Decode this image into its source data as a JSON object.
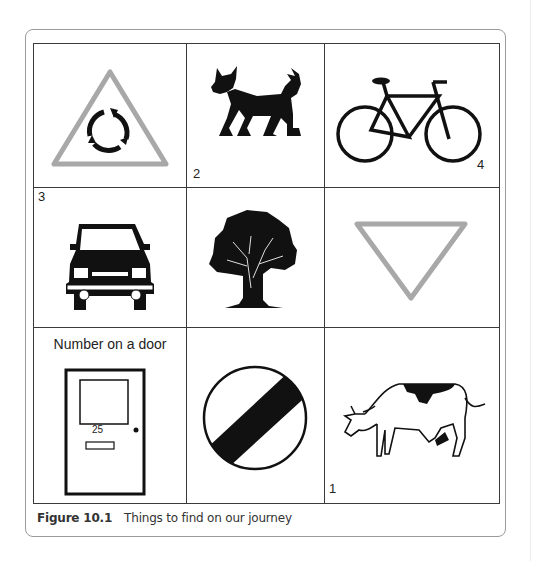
{
  "figure": {
    "label": "Figure 10.1",
    "caption": "Things to find on our journey"
  },
  "colors": {
    "grid_line": "#3a3a3a",
    "sign_grey": "#a8a8a8",
    "ink": "#111111"
  },
  "cells": [
    {
      "row": 1,
      "col": 1,
      "icon": "roundabout-warning-sign-icon",
      "number": ""
    },
    {
      "row": 1,
      "col": 2,
      "icon": "dog-icon",
      "number": "2"
    },
    {
      "row": 1,
      "col": 3,
      "icon": "bicycle-icon",
      "number": "4"
    },
    {
      "row": 2,
      "col": 1,
      "icon": "car-icon",
      "number": "3"
    },
    {
      "row": 2,
      "col": 2,
      "icon": "tree-icon",
      "number": ""
    },
    {
      "row": 2,
      "col": 3,
      "icon": "give-way-sign-icon",
      "number": ""
    },
    {
      "row": 3,
      "col": 1,
      "icon": "door-icon",
      "number": "",
      "title": "Number on a door",
      "door_number": "25"
    },
    {
      "row": 3,
      "col": 2,
      "icon": "national-speed-limit-sign-icon",
      "number": ""
    },
    {
      "row": 3,
      "col": 3,
      "icon": "cow-icon",
      "number": "1"
    }
  ]
}
